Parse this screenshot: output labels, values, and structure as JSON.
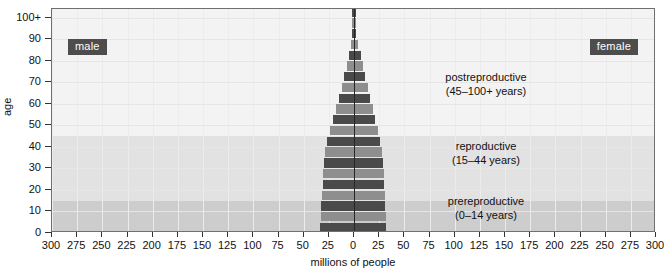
{
  "chart_data": {
    "type": "bar",
    "subtype": "population-pyramid",
    "title": "",
    "xlabel": "millions of people",
    "ylabel": "age",
    "xticks": [
      300,
      275,
      250,
      225,
      200,
      175,
      150,
      125,
      100,
      75,
      50,
      25,
      0,
      25,
      50,
      75,
      100,
      125,
      150,
      175,
      200,
      225,
      250,
      275,
      300
    ],
    "xlim": [
      -300,
      300
    ],
    "yticks": [
      "0",
      "10",
      "20",
      "30",
      "40",
      "50",
      "60",
      "70",
      "80",
      "90",
      "100+"
    ],
    "ylim": [
      0,
      104
    ],
    "grid": true,
    "legend_position": "inside-top-corners",
    "categories": [
      "0–4",
      "5–9",
      "10–14",
      "15–19",
      "20–24",
      "25–29",
      "30–34",
      "35–39",
      "40–44",
      "45–49",
      "50–54",
      "55–59",
      "60–64",
      "65–69",
      "70–74",
      "75–79",
      "80–84",
      "85–89",
      "90–94",
      "95–99",
      "100+"
    ],
    "series": [
      {
        "name": "male",
        "side": "left",
        "values": [
          34,
          33,
          33,
          32,
          31,
          31,
          30,
          29,
          27,
          24,
          21,
          18,
          15,
          12,
          10,
          7,
          5,
          3,
          1.5,
          0.5,
          0.2
        ]
      },
      {
        "name": "female",
        "side": "right",
        "values": [
          32,
          32,
          31,
          31,
          30,
          30,
          29,
          28,
          26,
          24,
          21,
          19,
          16,
          14,
          11,
          9,
          7,
          4,
          2.2,
          0.8,
          0.3
        ]
      }
    ],
    "bands": [
      {
        "name": "prereproductive",
        "label_line1": "prereproductive",
        "label_line2": "(0–14 years)",
        "age_min": 0,
        "age_max": 15,
        "color": "#cdcdcd"
      },
      {
        "name": "reproductive",
        "label_line1": "reproductive",
        "label_line2": "(15–44 years)",
        "age_min": 15,
        "age_max": 45,
        "color": "#e2e2e2"
      },
      {
        "name": "postreproductive",
        "label_line1": "postreproductive",
        "label_line2": "(45–100+ years)",
        "age_min": 45,
        "age_max": 104,
        "color": "#f3f3f3"
      }
    ],
    "bar_colors": {
      "dark": "#4a4a4a",
      "light": "#8e8e8e"
    },
    "tag_color": "#4d4d4d",
    "frame_color": "#6f6f6f"
  },
  "axes": {
    "y_title": "age",
    "x_title": "millions of people",
    "y_tick_labels": [
      "100+",
      "90",
      "80",
      "70",
      "60",
      "50",
      "40",
      "30",
      "20",
      "10",
      "0"
    ],
    "x_tick_labels": [
      "300",
      "275",
      "250",
      "225",
      "200",
      "175",
      "150",
      "125",
      "100",
      "75",
      "50",
      "25",
      "0",
      "25",
      "50",
      "75",
      "100",
      "125",
      "150",
      "175",
      "200",
      "225",
      "250",
      "275",
      "300"
    ]
  },
  "tags": {
    "male": "male",
    "female": "female"
  },
  "annotations": {
    "postreproductive": {
      "line1": "postreproductive",
      "line2": "(45–100+ years)"
    },
    "reproductive": {
      "line1": "reproductive",
      "line2": "(15–44 years)"
    },
    "prereproductive": {
      "line1": "prereproductive",
      "line2": "(0–14 years)"
    }
  }
}
